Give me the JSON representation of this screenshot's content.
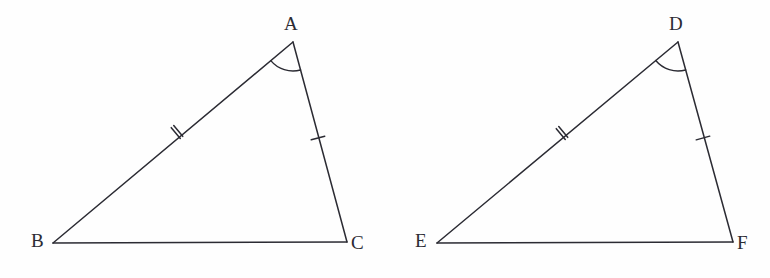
{
  "figure": {
    "width": 770,
    "height": 278,
    "background_color": "#fefefe",
    "stroke_color": "#2b2b33",
    "stroke_width": 1.5,
    "label_color": "#2b2b33",
    "label_font_size": 19
  },
  "triangles": [
    {
      "id": "triangle-abc",
      "name": "Triangle ABC",
      "vertices": [
        {
          "label": "A",
          "x": 293,
          "y": 42,
          "label_x": 284,
          "label_y": 14
        },
        {
          "label": "B",
          "x": 53,
          "y": 243,
          "label_x": 31,
          "label_y": 231
        },
        {
          "label": "C",
          "x": 347,
          "y": 242,
          "label_x": 351,
          "label_y": 233
        }
      ],
      "sides": [
        {
          "name": "side-ab",
          "from": "A",
          "to": "B",
          "tick_count": 2,
          "tick_x": 177,
          "tick_y": 132
        },
        {
          "name": "side-ac",
          "from": "A",
          "to": "C",
          "tick_count": 1,
          "tick_x": 318,
          "tick_y": 138
        },
        {
          "name": "side-bc",
          "from": "B",
          "to": "C",
          "tick_count": 0
        }
      ],
      "angle_marks": [
        {
          "name": "angle-a",
          "vertex": "A",
          "radius": 29,
          "arc_count": 1
        }
      ]
    },
    {
      "id": "triangle-def",
      "name": "Triangle DEF",
      "vertices": [
        {
          "label": "D",
          "x": 678,
          "y": 42,
          "label_x": 669,
          "label_y": 14
        },
        {
          "label": "E",
          "x": 437,
          "y": 243,
          "label_x": 415,
          "label_y": 231
        },
        {
          "label": "F",
          "x": 733,
          "y": 242,
          "label_x": 737,
          "label_y": 233
        }
      ],
      "sides": [
        {
          "name": "side-de",
          "from": "D",
          "to": "E",
          "tick_count": 2,
          "tick_x": 562,
          "tick_y": 133
        },
        {
          "name": "side-df",
          "from": "D",
          "to": "F",
          "tick_count": 1,
          "tick_x": 703,
          "tick_y": 138
        },
        {
          "name": "side-ef",
          "from": "E",
          "to": "F",
          "tick_count": 0
        }
      ],
      "angle_marks": [
        {
          "name": "angle-d",
          "vertex": "D",
          "radius": 29,
          "arc_count": 1
        }
      ]
    }
  ]
}
